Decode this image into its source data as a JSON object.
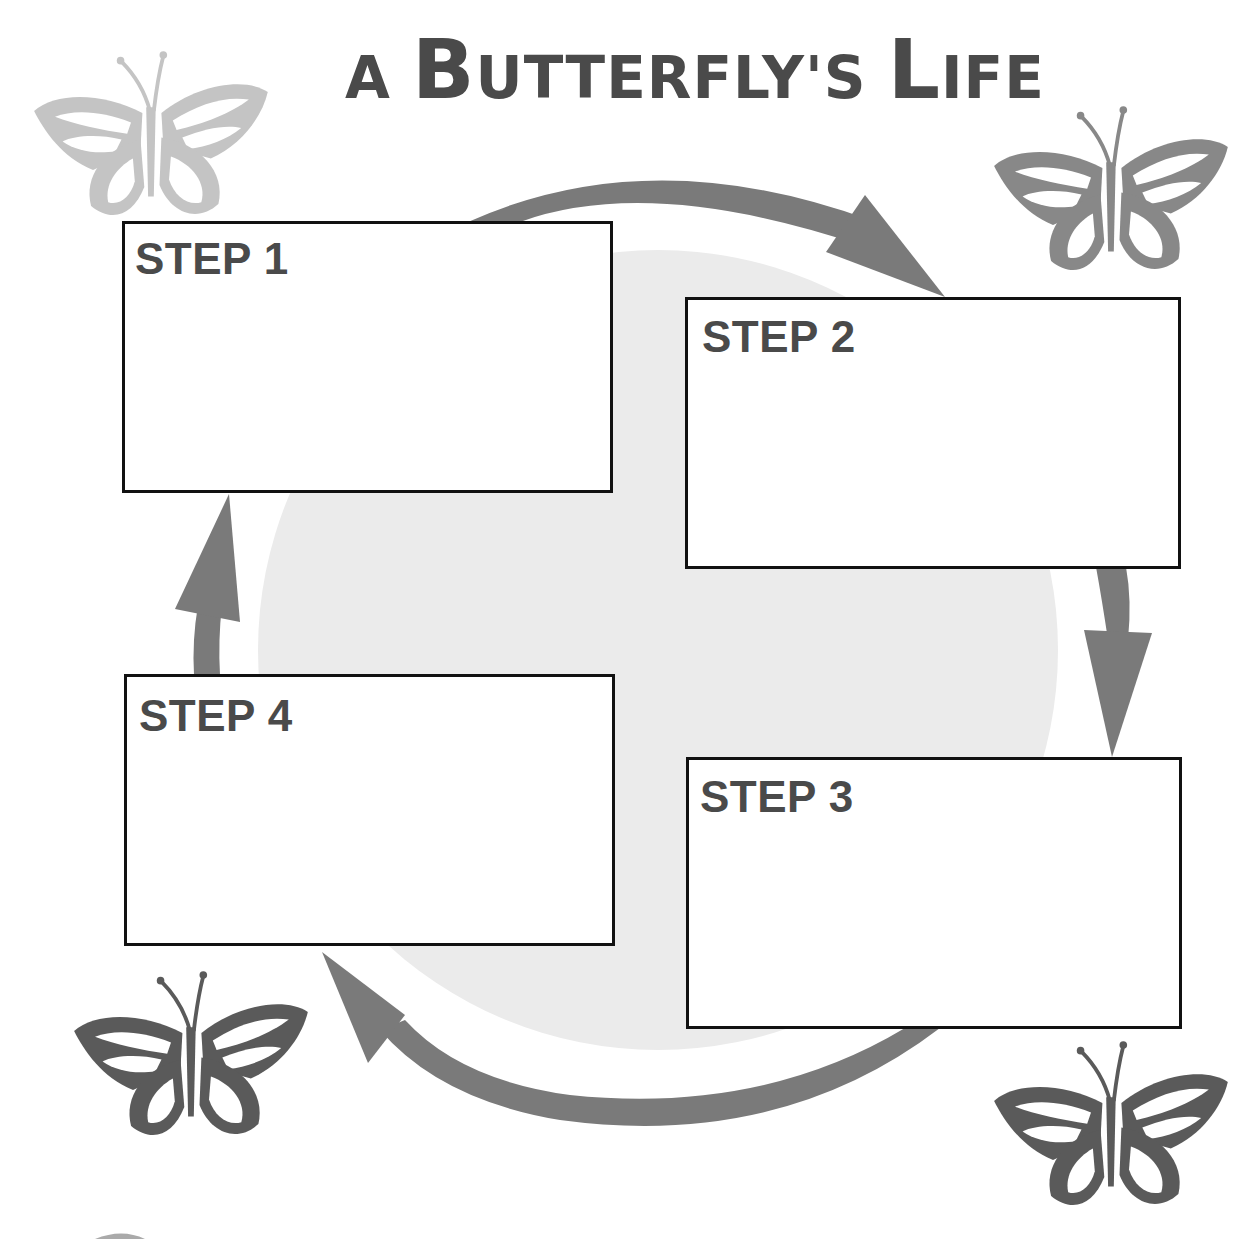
{
  "title": {
    "parts": [
      {
        "text": "A ",
        "size": "small"
      },
      {
        "text": "B",
        "size": "big"
      },
      {
        "text": "UTTERFLY'S ",
        "size": "small"
      },
      {
        "text": "L",
        "size": "big"
      },
      {
        "text": "IFE",
        "size": "small"
      }
    ],
    "full": "A BUTTERFLY'S LIFE"
  },
  "steps": [
    {
      "label": "STEP 1",
      "content": ""
    },
    {
      "label": "STEP 2",
      "content": ""
    },
    {
      "label": "STEP 3",
      "content": ""
    },
    {
      "label": "STEP 4",
      "content": ""
    }
  ],
  "cycle": {
    "direction": "clockwise",
    "arrows": [
      "step1-to-step2",
      "step2-to-step3",
      "step3-to-step4",
      "step4-to-step1"
    ]
  },
  "decorations": {
    "butterflies": [
      {
        "position": "top-left",
        "shade": "light-gray"
      },
      {
        "position": "top-right",
        "shade": "mid-gray"
      },
      {
        "position": "bottom-left",
        "shade": "dark-gray"
      },
      {
        "position": "bottom-right",
        "shade": "dark-gray"
      }
    ]
  },
  "colors": {
    "title": "#4a4a4a",
    "arrow": "#7a7a7a",
    "center_circle": "#ebebeb",
    "box_border": "#111111",
    "butterfly_light": "#c4c4c4",
    "butterfly_mid": "#888888",
    "butterfly_dark": "#5a5a5a"
  }
}
